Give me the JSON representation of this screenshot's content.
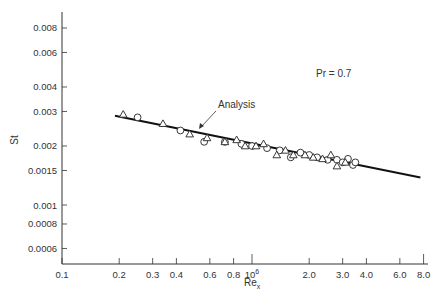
{
  "chart_data": {
    "type": "scatter",
    "title": "",
    "xlabel": "Re_x",
    "ylabel": "St",
    "xscale": "log",
    "yscale": "log",
    "xlim": [
      0.1,
      8.0
    ],
    "ylim": [
      0.0005,
      0.01
    ],
    "x_tick_labels": [
      "0.1",
      "0.2",
      "0.3",
      "0.4",
      "0.6",
      "0.8",
      "10^6",
      "2.0",
      "3.0",
      "4.0",
      "6.0",
      "8.0"
    ],
    "x_tick_values": [
      0.1,
      0.2,
      0.3,
      0.4,
      0.6,
      0.8,
      1.0,
      2.0,
      3.0,
      4.0,
      6.0,
      8.0
    ],
    "y_tick_labels": [
      "0.008",
      "0.006",
      "0.004",
      "0.003",
      "0.002",
      "0.0015",
      "0.001",
      "0.0008",
      "0.0006"
    ],
    "y_tick_values": [
      0.008,
      0.006,
      0.004,
      0.003,
      0.002,
      0.0015,
      0.001,
      0.0008,
      0.0006
    ],
    "grid": false,
    "annotations": [
      {
        "text": "Pr = 0.7",
        "x": 4.5,
        "y": 0.0055
      },
      {
        "text": "Analysis",
        "x": 1.0,
        "y": 0.0031,
        "arrow_to": [
          0.8,
          0.0025
        ]
      }
    ],
    "series": [
      {
        "name": "Analysis",
        "kind": "line",
        "x": [
          0.19,
          7.7
        ],
        "y": [
          0.00285,
          0.00138
        ]
      },
      {
        "name": "Data (circles)",
        "kind": "scatter",
        "marker": "circle",
        "x": [
          0.25,
          0.42,
          0.56,
          0.72,
          0.88,
          1.0,
          1.2,
          1.4,
          1.6,
          1.8,
          2.0,
          2.2,
          2.5,
          2.8,
          3.0,
          3.2,
          3.4,
          3.5
        ],
        "y": [
          0.0028,
          0.0024,
          0.0021,
          0.0021,
          0.00205,
          0.002,
          0.00195,
          0.0019,
          0.00175,
          0.00185,
          0.0018,
          0.00175,
          0.0017,
          0.0017,
          0.00165,
          0.00172,
          0.0016,
          0.00165
        ]
      },
      {
        "name": "Data (triangles)",
        "kind": "scatter",
        "marker": "triangle",
        "x": [
          0.21,
          0.34,
          0.47,
          0.58,
          0.72,
          0.83,
          0.92,
          1.05,
          1.15,
          1.35,
          1.5,
          1.65,
          1.9,
          2.1,
          2.35,
          2.6,
          2.8,
          3.1
        ],
        "y": [
          0.0029,
          0.0026,
          0.0023,
          0.0022,
          0.0021,
          0.00215,
          0.002,
          0.002,
          0.00205,
          0.0018,
          0.0019,
          0.0018,
          0.0018,
          0.00175,
          0.00172,
          0.0018,
          0.00158,
          0.00165
        ]
      }
    ]
  },
  "labels": {
    "x_axis": "Re",
    "x_axis_sub": "x",
    "y_axis": "St",
    "prandtl": "Pr = 0.7",
    "analysis": "Analysis"
  }
}
